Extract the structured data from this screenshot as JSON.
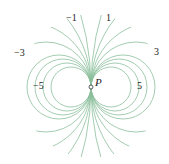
{
  "diagram": {
    "type": "level-curves",
    "point": {
      "label": "P",
      "x": 91,
      "y": 87
    },
    "curve_color": "#8cbf9c",
    "labels": [
      {
        "text": "−1",
        "x": 66,
        "y": 21
      },
      {
        "text": "1",
        "x": 106,
        "y": 21
      },
      {
        "text": "−3",
        "x": 14,
        "y": 56
      },
      {
        "text": "3",
        "x": 154,
        "y": 55
      },
      {
        "text": "−5",
        "x": 33,
        "y": 89
      },
      {
        "text": "5",
        "x": 137,
        "y": 89
      }
    ],
    "radii": [
      20,
      24,
      28,
      32,
      45,
      65,
      110,
      260
    ]
  }
}
